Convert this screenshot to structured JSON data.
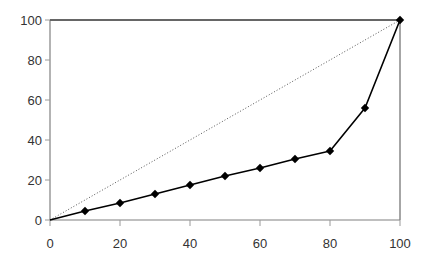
{
  "chart_data": {
    "type": "line",
    "title": "",
    "subtitle": "",
    "xlabel": "",
    "ylabel": "",
    "xlim": [
      0,
      100
    ],
    "ylim": [
      0,
      100
    ],
    "grid": false,
    "legend": null,
    "legend_position": "none",
    "xticks": [
      0,
      20,
      40,
      60,
      80,
      100
    ],
    "yticks": [
      0,
      20,
      40,
      60,
      80,
      100
    ],
    "xtick_labels": [
      "0",
      "20",
      "40",
      "60",
      "80",
      "100"
    ],
    "ytick_labels": [
      "0",
      "20",
      "40",
      "60",
      "80",
      "100"
    ],
    "series": [
      {
        "name": "lorenz-curve",
        "style": "solid-with-diamond-markers",
        "color": "#000000",
        "marker": "diamond",
        "x": [
          0,
          10,
          20,
          30,
          40,
          50,
          60,
          70,
          80,
          90,
          100
        ],
        "values": [
          0,
          4.5,
          8.5,
          13,
          17.5,
          22,
          26,
          30.5,
          34.5,
          56,
          100
        ],
        "marker_x": [
          10,
          20,
          30,
          40,
          50,
          60,
          70,
          80,
          90,
          100
        ],
        "marker_values": [
          4.5,
          8.5,
          13,
          17.5,
          22,
          26,
          30.5,
          34.5,
          56,
          100
        ]
      },
      {
        "name": "equality-line",
        "style": "dotted",
        "color": "#555555",
        "marker": "none",
        "x": [
          0,
          100
        ],
        "values": [
          0,
          100
        ]
      }
    ],
    "plot_border": {
      "top_line": true,
      "right_line": true,
      "left_axis": true,
      "bottom_axis": true,
      "color": "#808080"
    }
  }
}
